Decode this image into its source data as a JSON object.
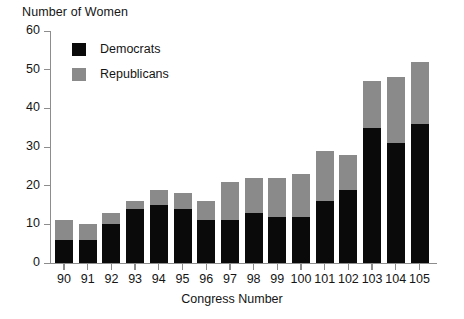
{
  "chart_data": {
    "type": "bar",
    "stacked": true,
    "title": "Number of Women",
    "xlabel": "Congress Number",
    "ylabel": "Number of Women",
    "categories": [
      "90",
      "91",
      "92",
      "93",
      "94",
      "95",
      "96",
      "97",
      "98",
      "99",
      "100",
      "101",
      "102",
      "103",
      "104",
      "105"
    ],
    "series": [
      {
        "name": "Democrats",
        "color": "#0a0a0a",
        "values": [
          6,
          6,
          10,
          14,
          15,
          14,
          11,
          11,
          13,
          12,
          12,
          16,
          19,
          35,
          31,
          36
        ]
      },
      {
        "name": "Republicans",
        "color": "#8a8a8a",
        "values": [
          5,
          4,
          3,
          2,
          4,
          4,
          5,
          10,
          9,
          10,
          11,
          13,
          9,
          12,
          17,
          16
        ]
      }
    ],
    "totals": [
      11,
      10,
      13,
      16,
      19,
      18,
      16,
      21,
      22,
      22,
      23,
      29,
      28,
      47,
      48,
      52
    ],
    "ylim": [
      0,
      60
    ],
    "yticks": [
      0,
      10,
      20,
      30,
      40,
      50,
      60
    ],
    "ytick_labels": [
      "0",
      "10",
      "20",
      "30",
      "40",
      "50",
      "60"
    ],
    "grid": false,
    "legend_position": "top-left-inside"
  },
  "legend": {
    "items": [
      {
        "label": "Democrats"
      },
      {
        "label": "Republicans"
      }
    ]
  },
  "axes": {
    "y_title": "Number of Women",
    "x_title": "Congress Number"
  },
  "colors": {
    "democrat": "#0a0a0a",
    "republican": "#8a8a8a",
    "axis": "#8d8d8d",
    "text": "#151515",
    "background": "#ffffff"
  }
}
